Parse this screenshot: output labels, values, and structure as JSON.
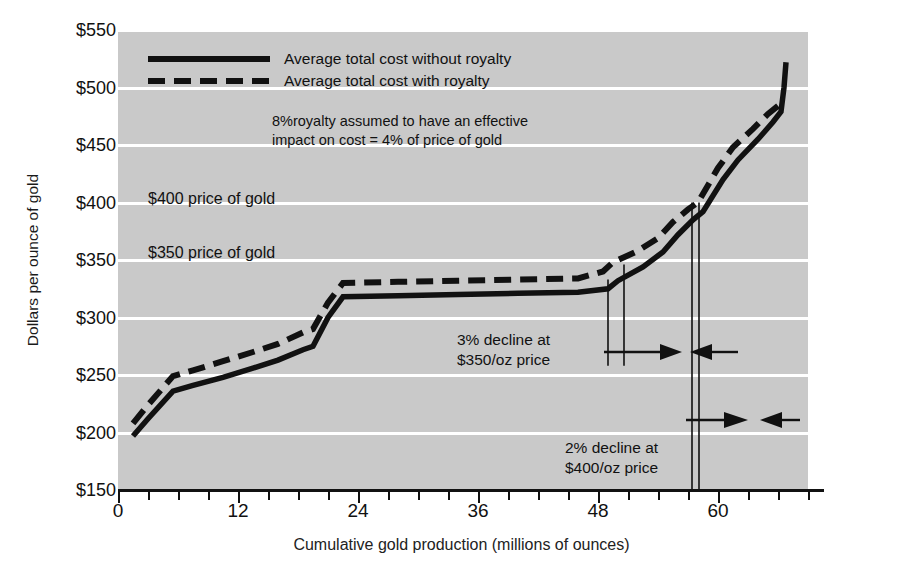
{
  "chart_data": {
    "type": "line",
    "title": "",
    "xlabel": "Cumulative gold production (millions of ounces)",
    "ylabel": "Dollars per ounce of gold",
    "xlim": [
      0,
      69
    ],
    "ylim": [
      150,
      550
    ],
    "ytick_labels": [
      "$550",
      "$500",
      "$450",
      "$400",
      "$350",
      "$300",
      "$250",
      "$200",
      "$150"
    ],
    "ytick_values": [
      550,
      500,
      450,
      400,
      350,
      300,
      250,
      200,
      150
    ],
    "xtick_labels": [
      "0",
      "12",
      "24",
      "36",
      "48",
      "60"
    ],
    "xtick_values": [
      0,
      12,
      24,
      36,
      48,
      60
    ],
    "xtick_minor_step": 3,
    "grid": "horizontal-white-on-gray",
    "legend_position": "top-center",
    "series": [
      {
        "name": "Average total cost without royalty",
        "style": "solid",
        "color": "#111111",
        "points": [
          [
            1.5,
            197
          ],
          [
            3.0,
            212
          ],
          [
            5.5,
            236
          ],
          [
            7.5,
            241
          ],
          [
            10.5,
            248
          ],
          [
            13.5,
            256
          ],
          [
            16.0,
            263
          ],
          [
            18.5,
            272
          ],
          [
            19.5,
            275
          ],
          [
            21.0,
            300
          ],
          [
            22.5,
            318
          ],
          [
            28.0,
            319
          ],
          [
            34.0,
            320
          ],
          [
            40.0,
            321
          ],
          [
            46.0,
            322
          ],
          [
            49.0,
            325
          ],
          [
            50.0,
            332
          ],
          [
            52.5,
            344
          ],
          [
            54.5,
            357
          ],
          [
            56.0,
            372
          ],
          [
            57.5,
            385
          ],
          [
            58.5,
            392
          ],
          [
            60.5,
            420
          ],
          [
            62.0,
            437
          ],
          [
            64.0,
            455
          ],
          [
            65.5,
            470
          ],
          [
            66.3,
            479
          ],
          [
            66.6,
            500
          ],
          [
            66.8,
            522
          ]
        ]
      },
      {
        "name": "Average total cost with royalty",
        "style": "dashed",
        "color": "#111111",
        "points": [
          [
            1.5,
            208
          ],
          [
            3.0,
            224
          ],
          [
            5.5,
            249
          ],
          [
            7.5,
            254
          ],
          [
            10.5,
            262
          ],
          [
            13.5,
            270
          ],
          [
            16.0,
            277
          ],
          [
            18.5,
            287
          ],
          [
            19.5,
            290
          ],
          [
            21.0,
            313
          ],
          [
            22.5,
            330
          ],
          [
            28.0,
            331
          ],
          [
            34.0,
            332
          ],
          [
            40.0,
            333
          ],
          [
            46.0,
            334
          ],
          [
            48.5,
            340
          ],
          [
            49.5,
            348
          ],
          [
            52.0,
            358
          ],
          [
            54.0,
            369
          ],
          [
            55.5,
            383
          ],
          [
            57.0,
            394
          ],
          [
            58.0,
            400
          ],
          [
            60.0,
            430
          ],
          [
            61.5,
            448
          ],
          [
            63.5,
            464
          ],
          [
            65.0,
            477
          ],
          [
            66.0,
            484
          ]
        ]
      }
    ],
    "reference_lines": [
      {
        "name": "decline-350-left",
        "x": 49.0,
        "y_top": 333,
        "y_bottom": 258
      },
      {
        "name": "decline-350-right",
        "x": 50.6,
        "y_top": 346,
        "y_bottom": 258
      },
      {
        "name": "decline-400-left",
        "x": 57.4,
        "y_top": 400,
        "y_bottom": 150
      },
      {
        "name": "decline-400-right",
        "x": 58.1,
        "y_top": 400,
        "y_bottom": 150
      }
    ],
    "annotations": [
      {
        "name": "royalty-assumption",
        "text": "8%royalty assumed to have an effective\nimpact on cost = 4% of price of gold"
      },
      {
        "name": "price-400",
        "text": "$400 price of gold",
        "y_value": 400
      },
      {
        "name": "price-350",
        "text": "$350 price of gold",
        "y_value": 350
      },
      {
        "name": "decline-350",
        "text": "3% decline at\n$350/oz price"
      },
      {
        "name": "decline-400",
        "text": "2% decline at\n$400/oz price"
      }
    ]
  },
  "legend": {
    "items": [
      {
        "label": "Average total cost without royalty",
        "style": "solid"
      },
      {
        "label": "Average total cost with royalty",
        "style": "dashed"
      }
    ]
  },
  "axes": {
    "y_title": "Dollars per ounce of gold",
    "x_title": "Cumulative gold production (millions of ounces)",
    "y_labels": [
      "$550",
      "$500",
      "$450",
      "$400",
      "$350",
      "$300",
      "$250",
      "$200",
      "$150"
    ],
    "x_labels": [
      "0",
      "12",
      "24",
      "36",
      "48",
      "60"
    ]
  },
  "notes": {
    "royalty": "8%royalty assumed to have an effective\nimpact on cost = 4% of price of gold",
    "price_400": "$400 price of gold",
    "price_350": "$350 price of gold",
    "decline_350": "3% decline at\n$350/oz price",
    "decline_400": "2% decline at\n$400/oz price"
  },
  "colors": {
    "plot_background": "#c9c9c9",
    "gridline": "#ffffff",
    "line": "#111111",
    "text": "#1a1a1a",
    "page_background": "#ffffff"
  }
}
